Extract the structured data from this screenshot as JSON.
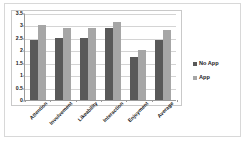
{
  "chart_data": {
    "type": "bar",
    "title": "",
    "subtitle": "",
    "xlabel": "",
    "ylabel": "",
    "categories": [
      "Attention",
      "Involvement",
      "Likeability",
      "Interaction",
      "Enjoyment",
      "Average"
    ],
    "series": [
      {
        "name": "No App",
        "color": "#595959",
        "values": [
          2.4,
          2.5,
          2.5,
          2.9,
          1.75,
          2.4
        ]
      },
      {
        "name": "App",
        "color": "#a6a6a6",
        "values": [
          3.0,
          2.9,
          2.9,
          3.15,
          2.0,
          2.8
        ]
      }
    ],
    "ylim": [
      0,
      3.5
    ],
    "ytick_values": [
      0,
      0.5,
      1,
      1.5,
      2,
      2.5,
      3,
      3.5
    ],
    "ytick_labels": [
      "0",
      "0.5",
      "1",
      "1.5",
      "2",
      "2.5",
      "3",
      "3.5"
    ],
    "grid": true,
    "grid_axis": "y",
    "legend_position": "right",
    "bar_orientation": "vertical",
    "category_label_rotation": -45,
    "plot_background": "#ffffff",
    "axis_color": "#9a9a9a",
    "gridline_color": "#d4d4d4",
    "frame_color": "#c9c9c9"
  }
}
